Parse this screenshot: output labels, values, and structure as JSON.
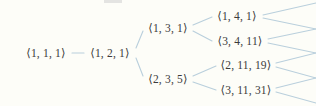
{
  "figure": {
    "kind": "binary-tree-diagram",
    "width": 316,
    "height": 106,
    "background_color": "#fdfdf8",
    "edge_color": "#b9cfdc",
    "node_text_color": "#3b3b3b"
  },
  "nodes": {
    "root": {
      "label": "⟨1, 1, 1⟩",
      "x": 46,
      "y": 53
    },
    "n2": {
      "label": "⟨1, 2, 1⟩",
      "x": 110,
      "y": 53
    },
    "n3a": {
      "label": "⟨1, 3, 1⟩",
      "x": 168,
      "y": 28
    },
    "n3b": {
      "label": "⟨2, 3, 5⟩",
      "x": 168,
      "y": 79
    },
    "leaf1": {
      "label": "⟨1, 4, 1⟩",
      "x": 237,
      "y": 16
    },
    "leaf2": {
      "label": "⟨3, 4, 11⟩",
      "x": 240,
      "y": 41
    },
    "leaf3": {
      "label": "⟨2, 11, 19⟩",
      "x": 246,
      "y": 65
    },
    "leaf4": {
      "label": "⟨3, 11, 31⟩",
      "x": 246,
      "y": 90
    }
  },
  "edges": [
    {
      "name": "root-to-n2",
      "x1": 72,
      "y1": 53,
      "x2": 84,
      "y2": 53
    },
    {
      "name": "n2-to-n3a",
      "x1": 136,
      "y1": 48,
      "x2": 143,
      "y2": 31
    },
    {
      "name": "n2-to-n3b",
      "x1": 136,
      "y1": 58,
      "x2": 143,
      "y2": 76
    },
    {
      "name": "n3a-to-leaf1",
      "x1": 193,
      "y1": 25,
      "x2": 212,
      "y2": 17
    },
    {
      "name": "n3a-to-leaf2",
      "x1": 193,
      "y1": 31,
      "x2": 212,
      "y2": 41
    },
    {
      "name": "n3b-to-leaf3",
      "x1": 193,
      "y1": 76,
      "x2": 216,
      "y2": 66
    },
    {
      "name": "n3b-to-leaf4",
      "x1": 193,
      "y1": 82,
      "x2": 216,
      "y2": 90
    }
  ],
  "stub_edges": [
    {
      "name": "leaf1-stub-upper",
      "x1": 263,
      "y1": 15,
      "x2": 316,
      "y2": 3
    },
    {
      "name": "leaf1-stub-lower",
      "x1": 263,
      "y1": 18,
      "x2": 316,
      "y2": 29
    },
    {
      "name": "leaf2-stub-upper",
      "x1": 268,
      "y1": 39,
      "x2": 316,
      "y2": 29
    },
    {
      "name": "leaf2-stub-lower",
      "x1": 268,
      "y1": 43,
      "x2": 316,
      "y2": 53
    },
    {
      "name": "leaf3-stub-upper",
      "x1": 276,
      "y1": 63,
      "x2": 316,
      "y2": 53
    },
    {
      "name": "leaf3-stub-lower",
      "x1": 276,
      "y1": 67,
      "x2": 316,
      "y2": 78
    },
    {
      "name": "leaf4-stub-upper",
      "x1": 276,
      "y1": 88,
      "x2": 316,
      "y2": 78
    },
    {
      "name": "leaf4-stub-lower",
      "x1": 276,
      "y1": 92,
      "x2": 316,
      "y2": 103
    }
  ]
}
